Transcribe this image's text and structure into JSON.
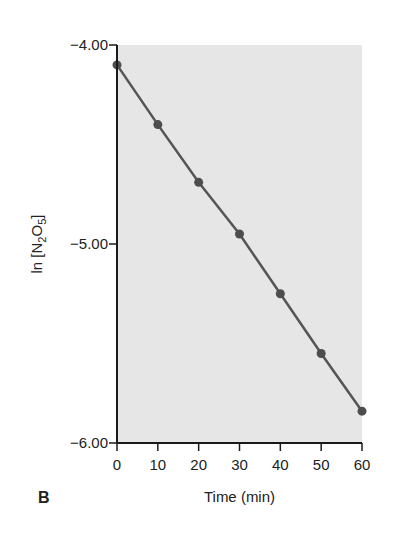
{
  "panel_label": "B",
  "chart_data": {
    "type": "line",
    "title": "",
    "xlabel": "Time (min)",
    "ylabel": "ln [N2O5]",
    "ylabel_parts": {
      "prefix": "ln [N",
      "sub1": "2",
      "mid": "O",
      "sub2": "5",
      "suffix": "]"
    },
    "x": [
      0,
      10,
      20,
      30,
      40,
      50,
      60
    ],
    "series": [
      {
        "name": "ln [N2O5]",
        "values": [
          -4.1,
          -4.4,
          -4.69,
          -4.95,
          -5.25,
          -5.55,
          -5.84
        ],
        "markers": true
      }
    ],
    "xlim": [
      0,
      60
    ],
    "ylim": [
      -6.0,
      -4.0
    ],
    "x_ticks": [
      0,
      10,
      20,
      30,
      40,
      50,
      60
    ],
    "x_tick_labels": [
      "0",
      "10",
      "20",
      "30",
      "40",
      "50",
      "60"
    ],
    "y_ticks": [
      -4.0,
      -5.0,
      -6.0
    ],
    "y_tick_labels": [
      "−4.00",
      "−5.00",
      "−6.00"
    ],
    "grid": false,
    "legend": null,
    "colors": {
      "plot_background": "#e6e6e6",
      "line": "#555555",
      "marker": "#4d4d4d",
      "axis": "#1a1a1a"
    }
  }
}
